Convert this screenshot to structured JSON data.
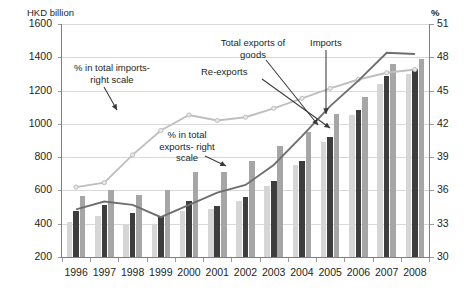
{
  "chart_data": {
    "type": "bar",
    "title": "",
    "subtitle": "",
    "xlabel": "",
    "ylabel": "HKD billion",
    "y2label": "%",
    "categories": [
      "1996",
      "1997",
      "1998",
      "1999",
      "2000",
      "2001",
      "2002",
      "2003",
      "2004",
      "2005",
      "2006",
      "2007",
      "2008"
    ],
    "ylim": [
      200,
      1600
    ],
    "y2lim": [
      30,
      51
    ],
    "yticks": [
      200,
      400,
      600,
      800,
      1000,
      1200,
      1400,
      1600
    ],
    "y2ticks": [
      30,
      33,
      36,
      39,
      42,
      45,
      48,
      51
    ],
    "grid": true,
    "legend_position": "annotations",
    "series": [
      {
        "name": "Re-exports",
        "chart_type": "bar",
        "axis": "left",
        "color": "#d6d6d6",
        "values": [
          412,
          444,
          397,
          399,
          474,
          489,
          536,
          627,
          751,
          891,
          1054,
          1242,
          1301
        ]
      },
      {
        "name": "Total exports of goods",
        "chart_type": "bar",
        "axis": "left",
        "color": "#3d3d3d",
        "values": [
          476,
          511,
          465,
          446,
          537,
          504,
          563,
          654,
          778,
          919,
          1083,
          1288,
          1327
        ]
      },
      {
        "name": "Imports",
        "chart_type": "bar",
        "axis": "left",
        "color": "#a6a6a6",
        "values": [
          567,
          602,
          575,
          600,
          710,
          711,
          774,
          870,
          949,
          1060,
          1164,
          1362,
          1390
        ]
      },
      {
        "name": "% in total imports- right scale",
        "chart_type": "line",
        "axis": "right",
        "color": "#bfbfbf",
        "values": [
          36.3,
          36.7,
          39.2,
          41.4,
          42.8,
          42.3,
          42.6,
          43.4,
          44.3,
          45.2,
          46.0,
          46.6,
          46.9
        ]
      },
      {
        "name": "% in total exports- right scale",
        "chart_type": "line",
        "axis": "right",
        "color": "#6f6f6f",
        "values": [
          34.3,
          35.0,
          34.7,
          33.6,
          34.7,
          35.8,
          36.5,
          38.3,
          40.9,
          43.6,
          45.9,
          48.4,
          48.3
        ]
      }
    ],
    "annotations": [
      {
        "name": "pct-in-total-imports",
        "text": "% in total imports-\nright scale"
      },
      {
        "name": "pct-in-total-exports",
        "text": "% in total\nexports- right\nscale"
      },
      {
        "name": "total-exports-of-goods",
        "text": "Total exports of\ngoods"
      },
      {
        "name": "re-exports",
        "text": "Re-exports"
      },
      {
        "name": "imports",
        "text": "Imports"
      }
    ]
  }
}
